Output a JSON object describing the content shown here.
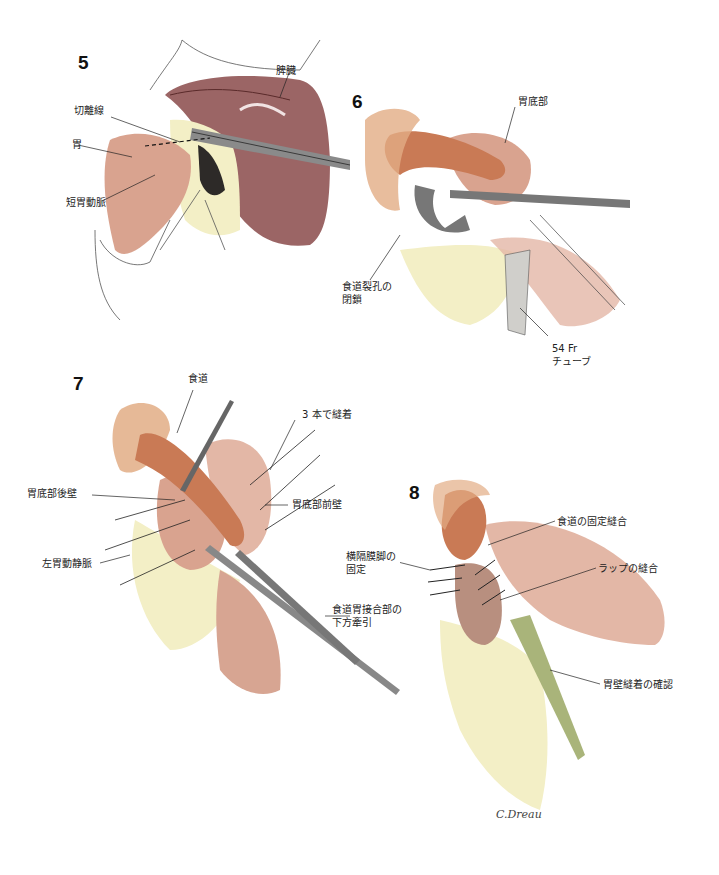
{
  "figure": {
    "signature": "C.Dreau"
  },
  "panels": [
    {
      "number": "5",
      "labels": {
        "spleen": "脾臓",
        "cut_line": "切離線",
        "stomach": "胃",
        "short_gastric_artery": "短胃動脈"
      }
    },
    {
      "number": "6",
      "labels": {
        "fundus": "胃底部",
        "hiatus_closure_1": "食道裂孔の",
        "hiatus_closure_2": "閉鎖",
        "tube_1": "54 Fr",
        "tube_2": "チューブ"
      }
    },
    {
      "number": "7",
      "labels": {
        "esophagus": "食道",
        "three_sutures": "3 本で縫着",
        "fundus_posterior": "胃底部後壁",
        "fundus_anterior": "胃底部前壁",
        "left_gastric_vessels": "左胃動静脈",
        "gej_traction_1": "食道胃接合部の",
        "gej_traction_2": "下方牽引"
      }
    },
    {
      "number": "8",
      "labels": {
        "crus_fixation_1": "横隔膜脚の",
        "crus_fixation_2": "固定",
        "esophageal_fixation": "食道の固定縫合",
        "wrap_suture": "ラップの縫合",
        "gastric_wall_check": "胃壁縫着の確認"
      }
    }
  ],
  "colors": {
    "organ_red": "#8a4a4a",
    "organ_pink": "#d9a38f",
    "esophagus_orange": "#c97a55",
    "fat_yellow": "#f3efc6",
    "tube_green": "#a9b47a",
    "instrument_gray": "#6b6b6b",
    "line": "#333333"
  }
}
